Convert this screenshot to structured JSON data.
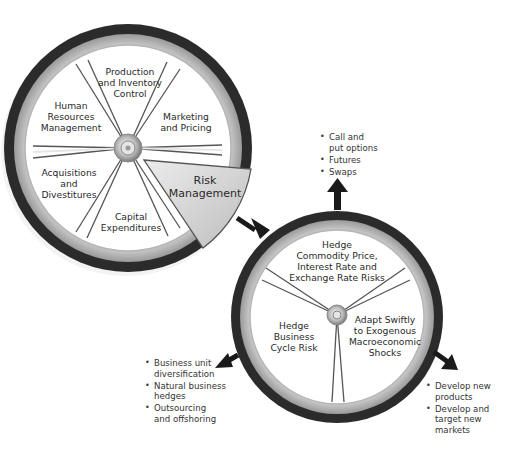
{
  "diagram": {
    "type": "wheel-diagram",
    "colors": {
      "tire": "#2b2b2b",
      "rim": "#cfcfcf",
      "face": "#ffffff",
      "spoke": "#555555",
      "wedge_fill": "#d4d4d4",
      "arrow": "#1a1a1a"
    },
    "main_wheel": {
      "segments": [
        {
          "id": "production",
          "label": "Production\nand Inventory\nControl"
        },
        {
          "id": "marketing",
          "label": "Marketing\nand Pricing"
        },
        {
          "id": "risk",
          "label": "Risk\nManagement",
          "highlighted": true
        },
        {
          "id": "capital",
          "label": "Capital\nExpenditures"
        },
        {
          "id": "acquisitions",
          "label": "Acquisitions\nand\nDivestitures"
        },
        {
          "id": "hr",
          "label": "Human\nResources\nManagement"
        }
      ]
    },
    "risk_wheel": {
      "segments": [
        {
          "id": "hedge-commodity",
          "label": "Hedge\nCommodity Price,\nInterest Rate and\nExchange Rate Risks"
        },
        {
          "id": "adapt",
          "label": "Adapt Swiftly\nto Exogenous\nMacroeconomic\nShocks"
        },
        {
          "id": "hedge-business",
          "label": "Hedge\nBusiness\nCycle Risk"
        }
      ]
    },
    "callouts": {
      "top": [
        "Call and\nput options",
        "Futures",
        "Swaps"
      ],
      "left": [
        "Business unit\ndiversification",
        "Natural business\nhedges",
        "Outsourcing\nand offshoring"
      ],
      "right": [
        "Develop new\nproducts",
        "Develop and\ntarget new\nmarkets"
      ]
    }
  }
}
